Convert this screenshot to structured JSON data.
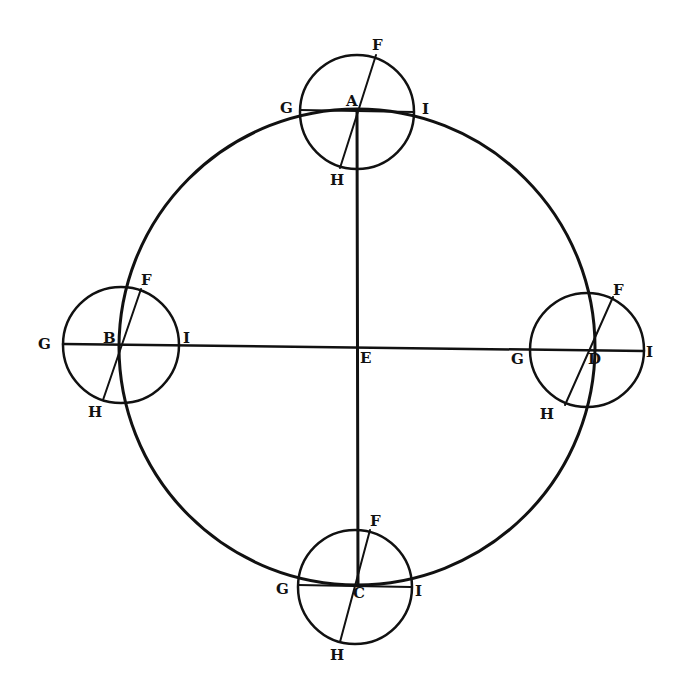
{
  "diagram": {
    "title": "",
    "colors": {
      "ink": "#111111",
      "paper": "#ffffff"
    },
    "main_circle": {
      "center_label": "E",
      "cx": 357,
      "cy": 347,
      "r": 240
    },
    "epicycles": [
      {
        "id": "A",
        "center_label": "A",
        "cx": 357,
        "cy": 110,
        "r": 57,
        "labels": {
          "F": "F",
          "G": "G",
          "H": "H",
          "I": "I"
        }
      },
      {
        "id": "B",
        "center_label": "B",
        "cx": 120,
        "cy": 345,
        "r": 57,
        "labels": {
          "F": "F",
          "G": "G",
          "H": "H",
          "I": "I"
        }
      },
      {
        "id": "D",
        "center_label": "D",
        "cx": 587,
        "cy": 350,
        "r": 57,
        "labels": {
          "F": "F",
          "G": "G",
          "H": "H",
          "I": "I"
        }
      },
      {
        "id": "C",
        "center_label": "C",
        "cx": 357,
        "cy": 585,
        "r": 57,
        "labels": {
          "F": "F",
          "G": "G",
          "H": "H",
          "I": "I"
        }
      }
    ],
    "lines": [
      {
        "name": "vertical-diameter-AC",
        "from": "A",
        "to": "C"
      },
      {
        "name": "horizontal-line-BD",
        "from": "G(B)",
        "to": "I(D)"
      }
    ]
  }
}
